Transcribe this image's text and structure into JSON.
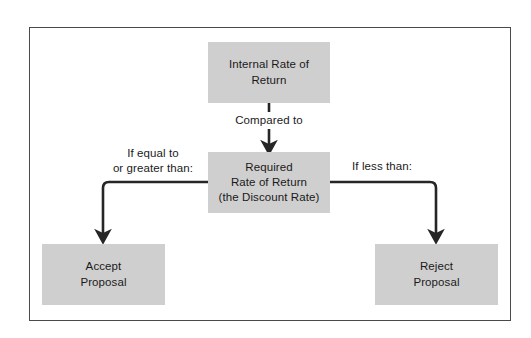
{
  "diagram": {
    "frame": {
      "border_color": "#4a4a4a",
      "background": "#ffffff"
    },
    "node_fill": "#cfcfcf",
    "text_color": "#1a1a1a",
    "connector_color": "#262626",
    "nodes": [
      {
        "id": "irr",
        "label": "Internal Rate of\nReturn"
      },
      {
        "id": "required",
        "label": "Required\nRate of Return\n(the Discount Rate)"
      },
      {
        "id": "accept",
        "label": "Accept\nProposal"
      },
      {
        "id": "reject",
        "label": "Reject\nProposal"
      }
    ],
    "edge_labels": [
      {
        "id": "compared-to",
        "label": "Compared to"
      },
      {
        "id": "if-equal-or-greater",
        "label": "If equal to\nor greater than:"
      },
      {
        "id": "if-less-than",
        "label": "If less than:"
      }
    ]
  }
}
